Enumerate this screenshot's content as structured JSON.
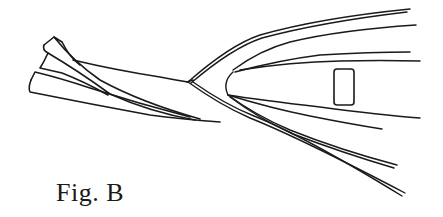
{
  "figure": {
    "caption": "Fig. B",
    "stroke_color": "#1a1a1a",
    "background_color": "#ffffff"
  }
}
